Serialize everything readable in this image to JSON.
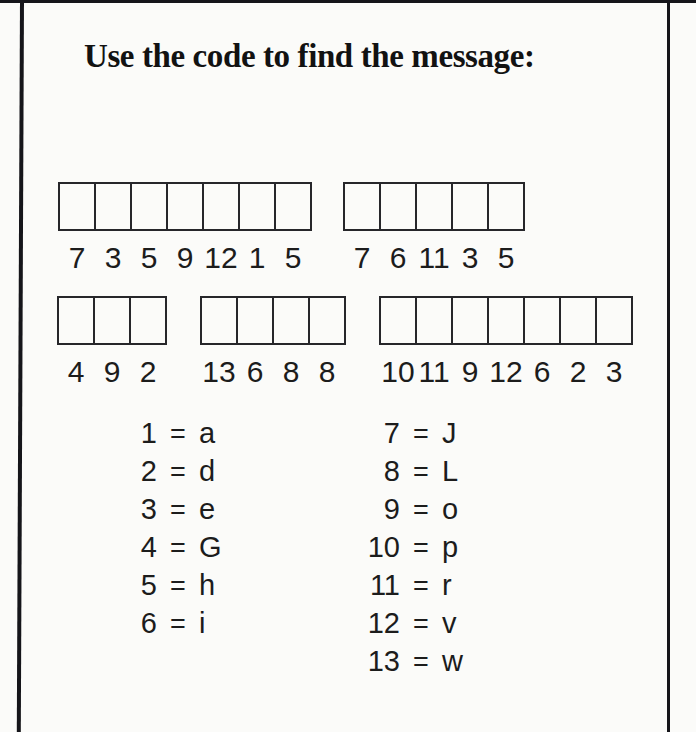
{
  "title": "Use the code to find the message:",
  "puzzle": {
    "rows": [
      {
        "words": [
          {
            "numbers": [
              "7",
              "3",
              "5",
              "9",
              "12",
              "1",
              "5"
            ]
          },
          {
            "numbers": [
              "7",
              "6",
              "11",
              "3",
              "5"
            ]
          }
        ]
      },
      {
        "words": [
          {
            "numbers": [
              "4",
              "9",
              "2"
            ]
          },
          {
            "numbers": [
              "13",
              "6",
              "8",
              "8"
            ]
          },
          {
            "numbers": [
              "10",
              "11",
              "9",
              "12",
              "6",
              "2",
              "3"
            ]
          }
        ]
      }
    ]
  },
  "key": {
    "equals": "=",
    "left": [
      {
        "num": "1",
        "letter": "a"
      },
      {
        "num": "2",
        "letter": "d"
      },
      {
        "num": "3",
        "letter": "e"
      },
      {
        "num": "4",
        "letter": "G"
      },
      {
        "num": "5",
        "letter": "h"
      },
      {
        "num": "6",
        "letter": "i"
      }
    ],
    "right": [
      {
        "num": "7",
        "letter": "J"
      },
      {
        "num": "8",
        "letter": "L"
      },
      {
        "num": "9",
        "letter": "o"
      },
      {
        "num": "10",
        "letter": "p"
      },
      {
        "num": "11",
        "letter": "r"
      },
      {
        "num": "12",
        "letter": "v"
      },
      {
        "num": "13",
        "letter": "w"
      }
    ]
  },
  "colors": {
    "ink": "#1c1c1c",
    "paper": "#fbfbf9",
    "border_line": "#15151a"
  }
}
